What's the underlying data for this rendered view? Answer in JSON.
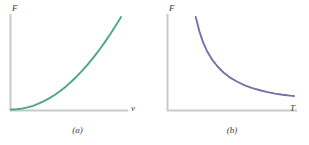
{
  "figure": {
    "background_color": "#ffffff",
    "axis_color": "#c9c9c9",
    "text_color": "#3a3a3a"
  },
  "chart_data": [
    {
      "type": "line",
      "panel_id": "a",
      "caption": "(a)",
      "title": "",
      "xlabel": "v",
      "ylabel": "F",
      "grid": false,
      "legend": "none",
      "series_color": "#4ca882",
      "xlim": [
        0,
        1
      ],
      "ylim": [
        0,
        1
      ],
      "x": [
        0.0,
        0.05,
        0.1,
        0.15,
        0.2,
        0.25,
        0.3,
        0.35,
        0.4,
        0.45,
        0.5,
        0.55,
        0.6,
        0.65,
        0.7,
        0.75,
        0.8,
        0.85,
        0.9,
        0.95,
        1.0
      ],
      "y": [
        0.0,
        0.003,
        0.01,
        0.023,
        0.04,
        0.063,
        0.09,
        0.123,
        0.16,
        0.203,
        0.25,
        0.303,
        0.36,
        0.423,
        0.49,
        0.563,
        0.64,
        0.723,
        0.81,
        0.903,
        1.0
      ],
      "annotation": "F increases with v (quadratic, drag-type relationship)"
    },
    {
      "type": "line",
      "panel_id": "b",
      "caption": "(b)",
      "title": "",
      "xlabel": "T",
      "ylabel": "F",
      "grid": false,
      "legend": "none",
      "series_color": "#7a6fa8",
      "xlim": [
        0,
        1
      ],
      "ylim": [
        0,
        1
      ],
      "x": [
        0.22,
        0.25,
        0.28,
        0.31,
        0.35,
        0.39,
        0.44,
        0.49,
        0.55,
        0.61,
        0.67,
        0.73,
        0.79,
        0.85,
        0.91,
        0.97,
        1.0
      ],
      "y": [
        1.0,
        0.84,
        0.72,
        0.63,
        0.54,
        0.47,
        0.4,
        0.348,
        0.3,
        0.262,
        0.232,
        0.208,
        0.188,
        0.172,
        0.16,
        0.15,
        0.146
      ],
      "annotation": "F decreases with T (inverse, hyperbolic decay)"
    }
  ],
  "panel_a": {
    "ylabel": "F",
    "xlabel": "v",
    "caption": "(a)"
  },
  "panel_b": {
    "ylabel": "F",
    "xlabel": "T",
    "caption": "(b)"
  }
}
